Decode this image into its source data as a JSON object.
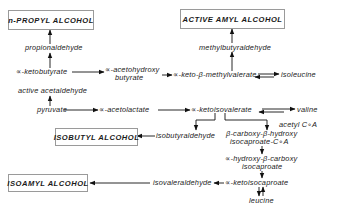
{
  "diagram": {
    "type": "metabolic-pathway",
    "alcohols": {
      "n_propyl": "n-PROPYL  ALCOHOL",
      "active_amyl": "ACTIVE  AMYL  ALCOHOL",
      "isobutyl": "ISOBUTYL  ALCOHOL",
      "isoamyl": "ISOAMYL  ALCOHOL"
    },
    "intermediates": {
      "propionaldehyde": "propionaldehyde",
      "ketobutyrate": "∝-ketobutyrate",
      "acetohydroxy_1": "∝-acetohydroxy",
      "acetohydroxy_2": "butyrate",
      "keto_methylvalerate": "∝-keto-β-methylvalerate",
      "isoleucine": "isoleucine",
      "methylbutyraldehyde": "methylbutyraldehyde",
      "active_acetaldehyde": "active  acetaldehyde",
      "pyruvate": "pyruvate",
      "acetolactate": "∝-acetolactate",
      "ketoisovalerate": "∝-ketoisovalerate",
      "valine": "valine",
      "acetyl_coa": "acetyl   C∘A",
      "isobutyraldehyde": "isobutyraldehyde",
      "carboxy_hydroxy_1": "β-carboxy-β-hydroxy",
      "carboxy_hydroxy_2": "isocaproate-C∘A",
      "hydroxy_carboxy_1": "∝-hydroxy-β-carboxy",
      "hydroxy_carboxy_2": "isocaproate",
      "isovaleraldehyde": "isovaleraldehyde",
      "ketoisocaproate": "∝-ketoisocaproate",
      "leucine": "leucine"
    },
    "edges": [
      [
        "propionaldehyde",
        "n-PROPYL ALCOHOL"
      ],
      [
        "∝-ketobutyrate",
        "propionaldehyde"
      ],
      [
        "∝-ketobutyrate",
        "∝-acetohydroxy butyrate"
      ],
      [
        "∝-acetohydroxy butyrate",
        "∝-keto-β-methylvalerate"
      ],
      [
        "∝-keto-β-methylvalerate",
        "methylbutyraldehyde"
      ],
      [
        "methylbutyraldehyde",
        "ACTIVE AMYL ALCOHOL"
      ],
      [
        "∝-keto-β-methylvalerate",
        "isoleucine",
        "reversible"
      ],
      [
        "pyruvate",
        "active acetaldehyde"
      ],
      [
        "pyruvate",
        "∝-acetolactate"
      ],
      [
        "∝-acetolactate",
        "∝-ketoisovalerate"
      ],
      [
        "∝-ketoisovalerate",
        "valine",
        "reversible"
      ],
      [
        "∝-ketoisovalerate",
        "isobutyraldehyde"
      ],
      [
        "isobutyraldehyde",
        "ISOBUTYL ALCOHOL"
      ],
      [
        "∝-ketoisovalerate",
        "β-carboxy-β-hydroxy isocaproate-CoA"
      ],
      [
        "β-carboxy-β-hydroxy isocaproate-CoA",
        "∝-hydroxy-β-carboxy isocaproate"
      ],
      [
        "∝-hydroxy-β-carboxy isocaproate",
        "∝-ketoisocaproate"
      ],
      [
        "∝-ketoisocaproate",
        "isovaleraldehyde"
      ],
      [
        "isovaleraldehyde",
        "ISOAMYL ALCOHOL"
      ],
      [
        "∝-ketoisocaproate",
        "leucine",
        "reversible"
      ]
    ]
  }
}
